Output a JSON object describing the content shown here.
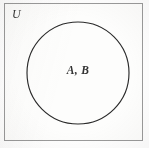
{
  "figure": {
    "kind": "venn-diagram",
    "background_color": "#fdfdfc",
    "border_color": "#9a9a9a",
    "stroke_color": "#2a2a2a"
  },
  "universe": {
    "label": "U",
    "rect": {
      "x": 4,
      "y": 3,
      "width": 139,
      "height": 138
    }
  },
  "sets": [
    {
      "label": "A, B",
      "shape": "circle",
      "center_x": 78,
      "center_y": 73,
      "radius": 51,
      "fill": "none"
    }
  ]
}
